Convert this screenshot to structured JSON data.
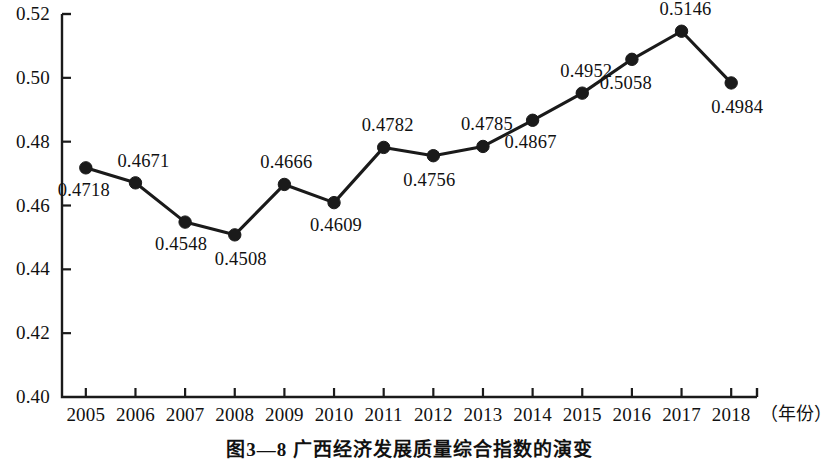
{
  "chart_data": {
    "type": "line",
    "title": "",
    "caption": "图3—8  广西经济发展质量综合指数的演变",
    "xlabel": "（年份）",
    "ylabel": "",
    "categories": [
      "2005",
      "2006",
      "2007",
      "2008",
      "2009",
      "2010",
      "2011",
      "2012",
      "2013",
      "2014",
      "2015",
      "2016",
      "2017",
      "2018"
    ],
    "values": [
      0.4718,
      0.4671,
      0.4548,
      0.4508,
      0.4666,
      0.4609,
      0.4782,
      0.4756,
      0.4785,
      0.4867,
      0.4952,
      0.5058,
      0.5146,
      0.4984
    ],
    "point_labels": [
      "0.4718",
      "0.4671",
      "0.4548",
      "0.4508",
      "0.4666",
      "0.4609",
      "0.4782",
      "0.4756",
      "0.4785",
      "0.4867",
      "0.4952",
      "0.5058",
      "0.5146",
      "0.4984"
    ],
    "label_positions": [
      "below",
      "above",
      "below",
      "below",
      "above",
      "below",
      "above",
      "below",
      "above",
      "below",
      "above",
      "below",
      "above",
      "below"
    ],
    "ylim": [
      0.4,
      0.52
    ],
    "yticks": [
      0.4,
      0.42,
      0.44,
      0.46,
      0.48,
      0.5,
      0.52
    ],
    "ytick_labels": [
      "0.40",
      "0.42",
      "0.44",
      "0.46",
      "0.48",
      "0.50",
      "0.52"
    ],
    "grid": false,
    "legend": null,
    "line_color": "#1a1a1a",
    "marker_color": "#1a1a1a",
    "axis_color": "#1a1a1a",
    "background": "#ffffff"
  }
}
